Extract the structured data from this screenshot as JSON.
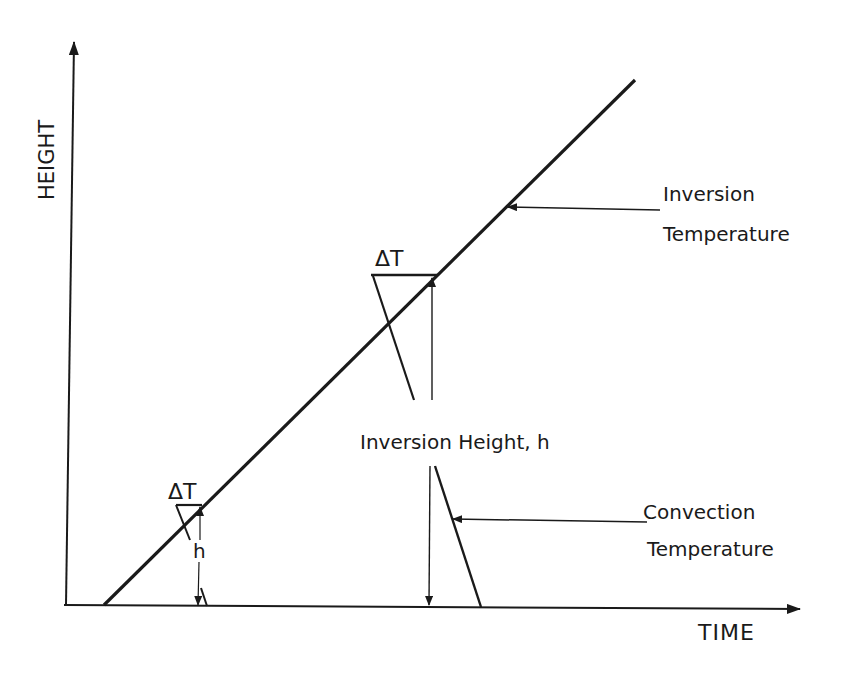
{
  "diagram": {
    "axes": {
      "y_label": "HEIGHT",
      "x_label": "TIME"
    },
    "curves": {
      "inversion_temperature": "Inversion",
      "inversion_temperature_line2": "Temperature",
      "convection_temperature": "Convection",
      "convection_temperature_line2": "Temperature"
    },
    "annotations": {
      "delta_t_upper": "ΔT",
      "delta_t_lower": "ΔT",
      "inversion_height": "Inversion Height, h",
      "h_small": "h"
    },
    "colors": {
      "ink": "#1a1a1a",
      "background": "#ffffff"
    }
  }
}
